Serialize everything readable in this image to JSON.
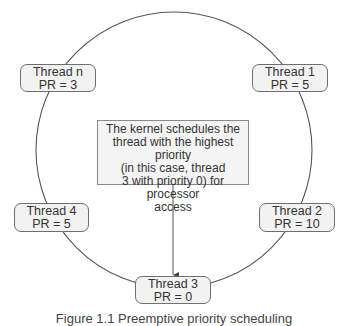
{
  "diagram": {
    "type": "round-robin priority ring",
    "ring": {
      "cx": 174,
      "cy": 150,
      "r": 138,
      "stroke": "#555555"
    },
    "kernel_note": {
      "lines": [
        "The kernel schedules the",
        "thread with the highest priority",
        "(in this case, thread",
        "3 with priority 0) for processor",
        "access"
      ]
    },
    "threads": [
      {
        "name": "Thread n",
        "priority": "PR = 3"
      },
      {
        "name": "Thread 1",
        "priority": "PR = 5"
      },
      {
        "name": "Thread 4",
        "priority": "PR = 5"
      },
      {
        "name": "Thread 2",
        "priority": "PR = 10"
      },
      {
        "name": "Thread 3",
        "priority": "PR = 0"
      }
    ],
    "arrow": {
      "from": "kernel_note",
      "to": "Thread 3"
    },
    "caption": "Figure 1.1 Preemptive priority scheduling"
  }
}
